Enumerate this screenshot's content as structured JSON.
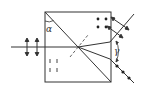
{
  "diagram": {
    "type": "polarizing-prism",
    "labels": {
      "apex_angle": "α",
      "divergence_angle": "γ"
    },
    "colors": {
      "stroke": "#333333",
      "dashed": "#555555",
      "background": "#ffffff"
    }
  }
}
